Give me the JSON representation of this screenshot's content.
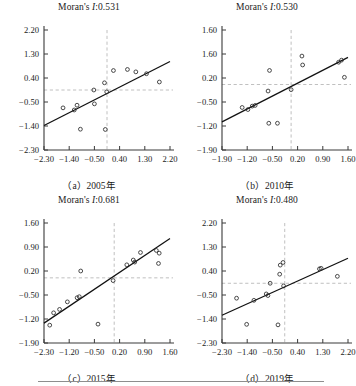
{
  "figure": {
    "type": "scatter-grid",
    "panel_count": 4,
    "note_color": "#111111"
  },
  "chart_data": [
    {
      "id": "panel-a",
      "type": "scatter",
      "title": "Moran's I:0.531",
      "title_prefix": "Moran's ",
      "title_stat": "I",
      "title_value": ":0.531",
      "caption": "（a）2005年",
      "moran_i": 0.531,
      "year": "2005",
      "xlabel": "",
      "ylabel": "",
      "xlim": [
        -2.3,
        2.2
      ],
      "ylim": [
        -2.3,
        2.2
      ],
      "xticks": [
        -2.3,
        -1.4,
        -0.5,
        0.4,
        1.3,
        2.2
      ],
      "xticklabels": [
        "-2.30",
        "-1.40",
        "-0.50",
        "0.40",
        "1.30",
        "2.20"
      ],
      "yticks": [
        -2.3,
        -1.4,
        -0.5,
        0.4,
        1.3,
        2.2
      ],
      "yticklabels": [
        "-2.30",
        "-1.40",
        "-0.50",
        "0.40",
        "1.30",
        "2.20"
      ],
      "ref_lines": {
        "vertical_x": -0.05,
        "horizontal_y": -0.05
      },
      "grid": false,
      "legend": "none",
      "fit_line": {
        "x0": -2.3,
        "y0": -1.38,
        "x1": 2.2,
        "y1": 1.02
      },
      "points": [
        {
          "x": -1.62,
          "y": -0.72
        },
        {
          "x": -1.22,
          "y": -0.8
        },
        {
          "x": -1.12,
          "y": -0.62
        },
        {
          "x": -1.0,
          "y": -1.52
        },
        {
          "x": -0.52,
          "y": -0.05
        },
        {
          "x": -0.5,
          "y": -0.57
        },
        {
          "x": -0.11,
          "y": -1.53
        },
        {
          "x": -0.14,
          "y": 0.22
        },
        {
          "x": -0.06,
          "y": -0.12
        },
        {
          "x": 0.18,
          "y": 0.68
        },
        {
          "x": 0.68,
          "y": 0.72
        },
        {
          "x": 0.98,
          "y": 0.63
        },
        {
          "x": 1.36,
          "y": 0.56
        },
        {
          "x": 1.82,
          "y": 0.25
        }
      ]
    },
    {
      "id": "panel-b",
      "type": "scatter",
      "title": "Moran's I:0.530",
      "title_prefix": "Moran's ",
      "title_stat": "I",
      "title_value": ":0.530",
      "caption": "（b）2010年",
      "moran_i": 0.53,
      "year": "2010",
      "xlabel": "",
      "ylabel": "",
      "xlim": [
        -1.9,
        1.6
      ],
      "ylim": [
        -1.9,
        1.6
      ],
      "xticks": [
        -1.9,
        -1.2,
        -0.5,
        0.2,
        0.9,
        1.6
      ],
      "xticklabels": [
        "-1.90",
        "-1.20",
        "-0.50",
        "0.20",
        "0.90",
        "1.60"
      ],
      "yticks": [
        -1.9,
        -1.2,
        -0.5,
        0.2,
        0.9,
        1.6
      ],
      "yticklabels": [
        "-1.90",
        "-1.20",
        "-0.50",
        "0.20",
        "1.60",
        "1.60"
      ],
      "ref_lines": {
        "vertical_x": 0.02,
        "horizontal_y": 0.01
      },
      "grid": false,
      "legend": "none",
      "fit_line": {
        "x0": -1.9,
        "y0": -1.08,
        "x1": 1.6,
        "y1": 0.8
      },
      "points": [
        {
          "x": -1.34,
          "y": -0.66
        },
        {
          "x": -1.18,
          "y": -0.72
        },
        {
          "x": -1.06,
          "y": -0.62
        },
        {
          "x": -0.98,
          "y": -0.6
        },
        {
          "x": -0.6,
          "y": -1.12
        },
        {
          "x": -0.58,
          "y": 0.42
        },
        {
          "x": -0.62,
          "y": -0.18
        },
        {
          "x": -0.36,
          "y": -1.12
        },
        {
          "x": 0.02,
          "y": -0.14
        },
        {
          "x": 0.32,
          "y": 0.84
        },
        {
          "x": 0.34,
          "y": 0.58
        },
        {
          "x": 1.34,
          "y": 0.66
        },
        {
          "x": 1.42,
          "y": 0.72
        },
        {
          "x": 1.5,
          "y": 0.22
        }
      ]
    },
    {
      "id": "panel-c",
      "type": "scatter",
      "title": "Moran's I:0.681",
      "title_prefix": "Moran's ",
      "title_stat": "I",
      "title_value": ":0.681",
      "caption": "（c）2015年",
      "moran_i": 0.681,
      "year": "2015",
      "xlabel": "",
      "ylabel": "",
      "xlim": [
        -2.3,
        1.95
      ],
      "ylim": [
        -1.9,
        1.6
      ],
      "xticks": [
        -2.3,
        -1.2,
        -0.5,
        0.2,
        0.9,
        1.6
      ],
      "xticklabels": [
        "-2.30",
        "-1.20",
        "-0.50",
        "0.20",
        "0.90",
        "1.60"
      ],
      "yticks": [
        -1.9,
        -1.2,
        -0.5,
        0.2,
        0.9,
        1.6
      ],
      "yticklabels": [
        "-1.90",
        "-1.20",
        "-0.50",
        "0.20",
        "0.90",
        "1.60"
      ],
      "ref_lines": {
        "vertical_x": 0.05,
        "horizontal_y": 0.0
      },
      "grid": false,
      "legend": "none",
      "fit_line": {
        "x0": -2.3,
        "y0": -1.32,
        "x1": 1.8,
        "y1": 1.15
      },
      "points": [
        {
          "x": -2.05,
          "y": -1.38
        },
        {
          "x": -1.88,
          "y": -1.02
        },
        {
          "x": -1.62,
          "y": -0.92
        },
        {
          "x": -1.28,
          "y": -0.7
        },
        {
          "x": -0.98,
          "y": -0.58
        },
        {
          "x": -0.92,
          "y": -0.55
        },
        {
          "x": -0.88,
          "y": 0.2
        },
        {
          "x": -0.4,
          "y": -1.35
        },
        {
          "x": 0.02,
          "y": -0.08
        },
        {
          "x": 0.4,
          "y": 0.38
        },
        {
          "x": 0.58,
          "y": 0.52
        },
        {
          "x": 0.62,
          "y": 0.46
        },
        {
          "x": 0.78,
          "y": 0.74
        },
        {
          "x": 1.22,
          "y": 0.8
        },
        {
          "x": 1.3,
          "y": 0.72
        },
        {
          "x": 1.28,
          "y": 0.42
        }
      ]
    },
    {
      "id": "panel-d",
      "type": "scatter",
      "title": "Moran's I:0.480",
      "title_prefix": "Moran's ",
      "title_stat": "I",
      "title_value": ":0.480",
      "caption": "（d）2019年",
      "moran_i": 0.48,
      "year": "2019",
      "xlabel": "",
      "ylabel": "",
      "xlim": [
        -2.3,
        2.2
      ],
      "ylim": [
        -2.3,
        2.2
      ],
      "xticks": [
        -2.3,
        -1.4,
        -0.5,
        0.4,
        1.3,
        2.2
      ],
      "xticklabels": [
        "-2.30",
        "-1.40",
        "-0.50",
        "0.40",
        "1.30",
        "2.20"
      ],
      "yticks": [
        -2.3,
        -1.4,
        -0.5,
        0.4,
        1.3,
        2.2
      ],
      "yticklabels": [
        "-2.30",
        "-1.40",
        "-0.50",
        "0.40",
        "1.30",
        "2.20"
      ],
      "ref_lines": {
        "vertical_x": -0.06,
        "horizontal_y": -0.06
      },
      "grid": false,
      "legend": "none",
      "fit_line": {
        "x0": -2.3,
        "y0": -1.26,
        "x1": 2.2,
        "y1": 0.88
      },
      "points": [
        {
          "x": -1.78,
          "y": -0.62
        },
        {
          "x": -1.42,
          "y": -1.6
        },
        {
          "x": -1.16,
          "y": -0.7
        },
        {
          "x": -0.72,
          "y": -0.46
        },
        {
          "x": -0.66,
          "y": -0.52
        },
        {
          "x": -0.58,
          "y": -0.06
        },
        {
          "x": -0.3,
          "y": -1.62
        },
        {
          "x": -0.24,
          "y": 0.28
        },
        {
          "x": -0.22,
          "y": 0.62
        },
        {
          "x": -0.12,
          "y": 0.72
        },
        {
          "x": -0.1,
          "y": -0.16
        },
        {
          "x": 1.18,
          "y": 0.48
        },
        {
          "x": 1.24,
          "y": 0.5
        },
        {
          "x": 1.82,
          "y": 0.2
        }
      ]
    }
  ]
}
